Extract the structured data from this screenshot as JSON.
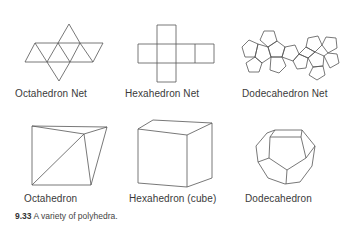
{
  "figure": {
    "number": "9.33",
    "caption": "A variety of polyhedra.",
    "labels": {
      "octahedron_net": "Octahedron Net",
      "hexahedron_net": "Hexahedron Net",
      "dodecahedron_net": "Dodecahedron Net",
      "octahedron": "Octahedron",
      "hexahedron": "Hexahedron (cube)",
      "dodecahedron": "Dodecahedron"
    },
    "stroke_color": "#555555"
  }
}
